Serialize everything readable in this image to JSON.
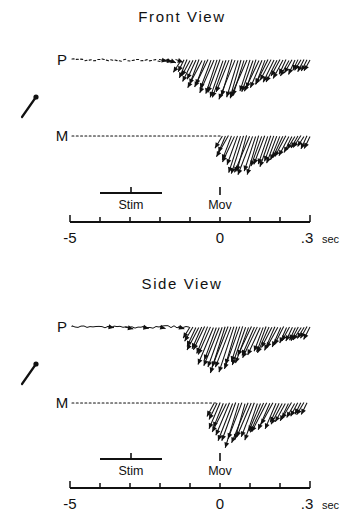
{
  "figure": {
    "background": "#ffffff",
    "ink_color": "#111111",
    "panels": [
      {
        "id": "front",
        "title": "Front View",
        "title_x": 182,
        "title_y": 22,
        "channels": [
          {
            "label": "P",
            "label_x": 62,
            "baseline_y": 60
          },
          {
            "label": "M",
            "label_x": 62,
            "baseline_y": 136
          }
        ],
        "scale_vector": {
          "x1": 22,
          "y1": 117,
          "x2": 36,
          "y2": 97,
          "dot_r": 2.6
        },
        "axis": {
          "y": 222,
          "x_left": 70,
          "x_right": 310,
          "tick_len": 5,
          "ticks": [
            -0.5,
            -0.4,
            -0.3,
            -0.2,
            -0.1,
            0.0,
            0.1,
            0.2,
            0.3
          ],
          "labels": [
            {
              "text": "-5",
              "value": -0.5,
              "dx": 0,
              "dy": 21
            },
            {
              "text": "0",
              "value": 0.0,
              "dx": 0,
              "dy": 21
            },
            {
              "text": ".3",
              "value": 0.3,
              "dx": -3,
              "dy": 21
            }
          ],
          "unit": "sec",
          "unit_x": 322,
          "unit_y": 243
        },
        "events": [
          {
            "name": "Stim",
            "type": "bar",
            "x_start": 100,
            "x_end": 162,
            "bar_y": 193,
            "tick_x": 131,
            "tick_y1": 187,
            "tick_y2": 193,
            "label_x": 131,
            "label_y": 209
          },
          {
            "name": "Mov",
            "type": "tick",
            "tick_x": 220,
            "tick_y1": 187,
            "tick_y2": 195,
            "label_x": 220,
            "label_y": 209
          }
        ]
      },
      {
        "id": "side",
        "title": "Side View",
        "title_x": 182,
        "title_y": 289,
        "channels": [
          {
            "label": "P",
            "label_x": 62,
            "baseline_y": 327
          },
          {
            "label": "M",
            "label_x": 62,
            "baseline_y": 403
          }
        ],
        "scale_vector": {
          "x1": 22,
          "y1": 384,
          "x2": 36,
          "y2": 364,
          "dot_r": 2.6
        },
        "axis": {
          "y": 488,
          "x_left": 70,
          "x_right": 310,
          "tick_len": 5,
          "ticks": [
            -0.5,
            -0.4,
            -0.3,
            -0.2,
            -0.1,
            0.0,
            0.1,
            0.2,
            0.3
          ],
          "labels": [
            {
              "text": "-5",
              "value": -0.5,
              "dx": 0,
              "dy": 21
            },
            {
              "text": "0",
              "value": 0.0,
              "dx": 0,
              "dy": 21
            },
            {
              "text": ".3",
              "value": 0.3,
              "dx": -3,
              "dy": 21
            }
          ],
          "unit": "sec",
          "unit_x": 322,
          "unit_y": 509
        },
        "events": [
          {
            "name": "Stim",
            "type": "bar",
            "x_start": 100,
            "x_end": 162,
            "bar_y": 459,
            "tick_x": 131,
            "tick_y1": 453,
            "tick_y2": 459,
            "label_x": 131,
            "label_y": 475
          },
          {
            "name": "Mov",
            "type": "tick",
            "tick_x": 220,
            "tick_y1": 453,
            "tick_y2": 461,
            "label_x": 220,
            "label_y": 475
          }
        ]
      }
    ]
  },
  "chart_data": {
    "type": "vector-field-timeseries",
    "xlabel": "time",
    "ylabel": "",
    "xlim": [
      -0.5,
      0.3
    ],
    "x_unit": "sec",
    "x_tick_values": [
      -0.5,
      -0.4,
      -0.3,
      -0.2,
      -0.1,
      0.0,
      0.1,
      0.2,
      0.3
    ],
    "x_tick_labels": [
      "-5",
      "",
      "",
      "",
      "",
      "0",
      "",
      "",
      ".3"
    ],
    "grid": false,
    "legend": null,
    "annotations": [
      {
        "text": "Stim",
        "x_start": -0.4,
        "x_end": -0.19,
        "x_mark": -0.3
      },
      {
        "text": "Mov",
        "x_mark": 0.0
      }
    ],
    "series": [
      {
        "panel": "Front View",
        "name": "P",
        "baseline_pixel_y": 60,
        "pre_movement_style": "dotted-noisy",
        "vectors_start_time": -0.13,
        "vectors_end_time": 0.3,
        "vector_count": 44,
        "peak_time": 0.055,
        "peak_magnitude_px": 42
      },
      {
        "panel": "Front View",
        "name": "M",
        "baseline_pixel_y": 136,
        "pre_movement_style": "dotted-flat",
        "vectors_start_time": 0.008,
        "vectors_end_time": 0.3,
        "vector_count": 30,
        "peak_time": 0.095,
        "peak_magnitude_px": 44
      },
      {
        "panel": "Side View",
        "name": "P",
        "baseline_pixel_y": 327,
        "pre_movement_style": "continuous-wiggle",
        "vectors_start_time": -0.1,
        "vectors_end_time": 0.3,
        "vector_count": 42,
        "peak_time": 0.03,
        "peak_magnitude_px": 45
      },
      {
        "panel": "Side View",
        "name": "M",
        "baseline_pixel_y": 403,
        "pre_movement_style": "dotted-flat",
        "vectors_start_time": -0.02,
        "vectors_end_time": 0.29,
        "vector_count": 31,
        "peak_time": 0.06,
        "peak_magnitude_px": 46
      }
    ]
  }
}
